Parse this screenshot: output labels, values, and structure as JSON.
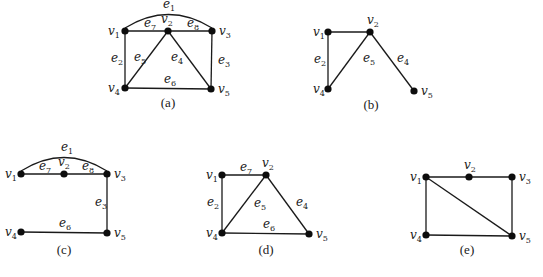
{
  "figures": [
    {
      "id": "a",
      "caption": "(a)",
      "caption_pos": [
        168,
        107
      ],
      "nodes": [
        {
          "name": "v1",
          "x": 125,
          "y": 31,
          "label": "v",
          "sub": "1",
          "lx": 108,
          "ly": 35
        },
        {
          "name": "v2",
          "x": 168,
          "y": 31,
          "label": "v",
          "sub": "2",
          "lx": 161,
          "ly": 23
        },
        {
          "name": "v3",
          "x": 212,
          "y": 31,
          "label": "v",
          "sub": "3",
          "lx": 219,
          "ly": 35
        },
        {
          "name": "v4",
          "x": 125,
          "y": 88,
          "label": "v",
          "sub": "4",
          "lx": 108,
          "ly": 92
        },
        {
          "name": "v5",
          "x": 211,
          "y": 89,
          "label": "v",
          "sub": "5",
          "lx": 218,
          "ly": 93
        }
      ],
      "edges": [
        {
          "name": "e1",
          "from": "v1",
          "to": "v3",
          "curve": true,
          "label": "e",
          "sub": "1",
          "lx": 163,
          "ly": 8
        },
        {
          "name": "e2",
          "from": "v1",
          "to": "v4",
          "label": "e",
          "sub": "2",
          "lx": 111,
          "ly": 62
        },
        {
          "name": "e3",
          "from": "v3",
          "to": "v5",
          "label": "e",
          "sub": "3",
          "lx": 218,
          "ly": 64
        },
        {
          "name": "e4",
          "from": "v2",
          "to": "v5",
          "label": "e",
          "sub": "4",
          "lx": 171,
          "ly": 61
        },
        {
          "name": "e5",
          "from": "v2",
          "to": "v4",
          "label": "e",
          "sub": "5",
          "lx": 134,
          "ly": 61
        },
        {
          "name": "e6",
          "from": "v4",
          "to": "v5",
          "label": "e",
          "sub": "6",
          "lx": 164,
          "ly": 83
        },
        {
          "name": "e7",
          "from": "v1",
          "to": "v2",
          "label": "e",
          "sub": "7",
          "lx": 144,
          "ly": 27
        },
        {
          "name": "e8",
          "from": "v2",
          "to": "v3",
          "label": "e",
          "sub": "8",
          "lx": 187,
          "ly": 27
        }
      ]
    },
    {
      "id": "b",
      "caption": "(b)",
      "caption_pos": [
        371,
        109
      ],
      "nodes": [
        {
          "name": "v1",
          "x": 328,
          "y": 32,
          "label": "v",
          "sub": "1",
          "lx": 313,
          "ly": 36
        },
        {
          "name": "v2",
          "x": 370,
          "y": 32,
          "label": "v",
          "sub": "2",
          "lx": 367,
          "ly": 24
        },
        {
          "name": "v4",
          "x": 328,
          "y": 89,
          "label": "v",
          "sub": "4",
          "lx": 313,
          "ly": 93
        },
        {
          "name": "v5",
          "x": 414,
          "y": 91,
          "label": "v",
          "sub": "5",
          "lx": 421,
          "ly": 95
        }
      ],
      "edges": [
        {
          "name": "e-v1-v2",
          "from": "v1",
          "to": "v2",
          "label": "",
          "sub": ""
        },
        {
          "name": "e2",
          "from": "v1",
          "to": "v4",
          "label": "e",
          "sub": "2",
          "lx": 314,
          "ly": 63
        },
        {
          "name": "e5",
          "from": "v2",
          "to": "v4",
          "label": "e",
          "sub": "5",
          "lx": 363,
          "ly": 62
        },
        {
          "name": "e4",
          "from": "v2",
          "to": "v5",
          "label": "e",
          "sub": "4",
          "lx": 397,
          "ly": 62
        }
      ]
    },
    {
      "id": "c",
      "caption": "(c)",
      "caption_pos": [
        64,
        254
      ],
      "nodes": [
        {
          "name": "v1",
          "x": 21,
          "y": 174,
          "label": "v",
          "sub": "1",
          "lx": 5,
          "ly": 178
        },
        {
          "name": "v2",
          "x": 64,
          "y": 174,
          "label": "v",
          "sub": "2",
          "lx": 58,
          "ly": 166
        },
        {
          "name": "v3",
          "x": 107,
          "y": 174,
          "label": "v",
          "sub": "3",
          "lx": 114,
          "ly": 178
        },
        {
          "name": "v4",
          "x": 21,
          "y": 232,
          "label": "v",
          "sub": "4",
          "lx": 5,
          "ly": 236
        },
        {
          "name": "v5",
          "x": 107,
          "y": 233,
          "label": "v",
          "sub": "5",
          "lx": 114,
          "ly": 237
        }
      ],
      "edges": [
        {
          "name": "e1",
          "from": "v1",
          "to": "v3",
          "curve": true,
          "label": "e",
          "sub": "1",
          "lx": 61,
          "ly": 151
        },
        {
          "name": "e7",
          "from": "v1",
          "to": "v2",
          "label": "e",
          "sub": "7",
          "lx": 39,
          "ly": 170
        },
        {
          "name": "e8",
          "from": "v2",
          "to": "v3",
          "label": "e",
          "sub": "8",
          "lx": 82,
          "ly": 170
        },
        {
          "name": "e3",
          "from": "v3",
          "to": "v5",
          "label": "e",
          "sub": "3",
          "lx": 95,
          "ly": 206
        },
        {
          "name": "e6",
          "from": "v4",
          "to": "v5",
          "label": "e",
          "sub": "6",
          "lx": 59,
          "ly": 227
        }
      ]
    },
    {
      "id": "d",
      "caption": "(d)",
      "caption_pos": [
        266,
        254
      ],
      "nodes": [
        {
          "name": "v1",
          "x": 222,
          "y": 175,
          "label": "v",
          "sub": "1",
          "lx": 206,
          "ly": 179
        },
        {
          "name": "v2",
          "x": 266,
          "y": 175,
          "label": "v",
          "sub": "2",
          "lx": 262,
          "ly": 167
        },
        {
          "name": "v4",
          "x": 222,
          "y": 233,
          "label": "v",
          "sub": "4",
          "lx": 206,
          "ly": 237
        },
        {
          "name": "v5",
          "x": 309,
          "y": 234,
          "label": "v",
          "sub": "5",
          "lx": 316,
          "ly": 238
        }
      ],
      "edges": [
        {
          "name": "e7",
          "from": "v1",
          "to": "v2",
          "label": "e",
          "sub": "7",
          "lx": 240,
          "ly": 171
        },
        {
          "name": "e2",
          "from": "v1",
          "to": "v4",
          "label": "e",
          "sub": "2",
          "lx": 207,
          "ly": 206
        },
        {
          "name": "e5",
          "from": "v2",
          "to": "v4",
          "label": "e",
          "sub": "5",
          "lx": 254,
          "ly": 207
        },
        {
          "name": "e4",
          "from": "v2",
          "to": "v5",
          "label": "e",
          "sub": "4",
          "lx": 296,
          "ly": 206
        },
        {
          "name": "e6",
          "from": "v4",
          "to": "v5",
          "label": "e",
          "sub": "6",
          "lx": 263,
          "ly": 228
        }
      ]
    },
    {
      "id": "e",
      "caption": "(e)",
      "caption_pos": [
        467,
        254
      ],
      "nodes": [
        {
          "name": "v1",
          "x": 426,
          "y": 177,
          "label": "v",
          "sub": "1",
          "lx": 410,
          "ly": 181
        },
        {
          "name": "v2",
          "x": 469,
          "y": 177,
          "label": "v",
          "sub": "2",
          "lx": 464,
          "ly": 169
        },
        {
          "name": "v3",
          "x": 512,
          "y": 177,
          "label": "v",
          "sub": "3",
          "lx": 519,
          "ly": 181
        },
        {
          "name": "v4",
          "x": 426,
          "y": 235,
          "label": "v",
          "sub": "4",
          "lx": 410,
          "ly": 239
        },
        {
          "name": "v5",
          "x": 512,
          "y": 236,
          "label": "v",
          "sub": "5",
          "lx": 519,
          "ly": 240
        }
      ],
      "edges": [
        {
          "name": "e-v1-v2",
          "from": "v1",
          "to": "v2",
          "label": "",
          "sub": ""
        },
        {
          "name": "e-v2-v3",
          "from": "v2",
          "to": "v3",
          "label": "",
          "sub": ""
        },
        {
          "name": "e-v1-v4",
          "from": "v1",
          "to": "v4",
          "label": "",
          "sub": ""
        },
        {
          "name": "e-v1-v5",
          "from": "v1",
          "to": "v5",
          "label": "",
          "sub": ""
        },
        {
          "name": "e-v3-v5",
          "from": "v3",
          "to": "v5",
          "label": "",
          "sub": ""
        },
        {
          "name": "e-v4-v5",
          "from": "v4",
          "to": "v5",
          "label": "",
          "sub": ""
        }
      ]
    }
  ]
}
